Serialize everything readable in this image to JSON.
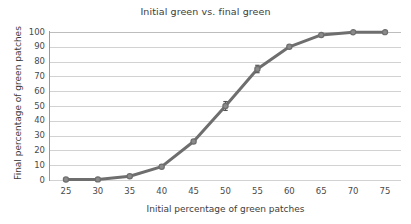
{
  "chart_data": {
    "type": "line",
    "title": "Initial green vs. final green",
    "xlabel": "Initial percentage of green patches",
    "ylabel": "Final percentage of green patches",
    "x": [
      25,
      30,
      35,
      40,
      45,
      50,
      55,
      60,
      65,
      70,
      75
    ],
    "values": [
      0.3,
      0.4,
      2.5,
      9,
      26,
      50,
      75,
      90,
      98,
      99.8,
      99.9
    ],
    "series": [
      {
        "name": "Final percentage of green patches",
        "values": [
          0.3,
          0.4,
          2.5,
          9,
          26,
          50,
          75,
          90,
          98,
          99.8,
          99.9
        ]
      }
    ],
    "error_bars": [
      {
        "x": 50,
        "y": 50,
        "low": 47,
        "high": 53
      },
      {
        "x": 55,
        "y": 75,
        "low": 72.5,
        "high": 77.5
      }
    ],
    "xlim": [
      22.5,
      77.5
    ],
    "ylim": [
      0,
      100
    ],
    "xticks": [
      "25",
      "30",
      "35",
      "40",
      "45",
      "50",
      "55",
      "60",
      "65",
      "70",
      "75"
    ],
    "yticks": [
      "0",
      "10",
      "20",
      "30",
      "40",
      "50",
      "60",
      "70",
      "80",
      "90",
      "100"
    ],
    "grid": "horizontal",
    "legend": "none",
    "marker": "circle",
    "line_color": "#6e6e6e",
    "marker_color": "#6e6e6e",
    "grid_color": "#d2d2d2",
    "axis_color": "#9a9a9a",
    "text_color": "#3c3c3c",
    "background": "#ffffff"
  }
}
